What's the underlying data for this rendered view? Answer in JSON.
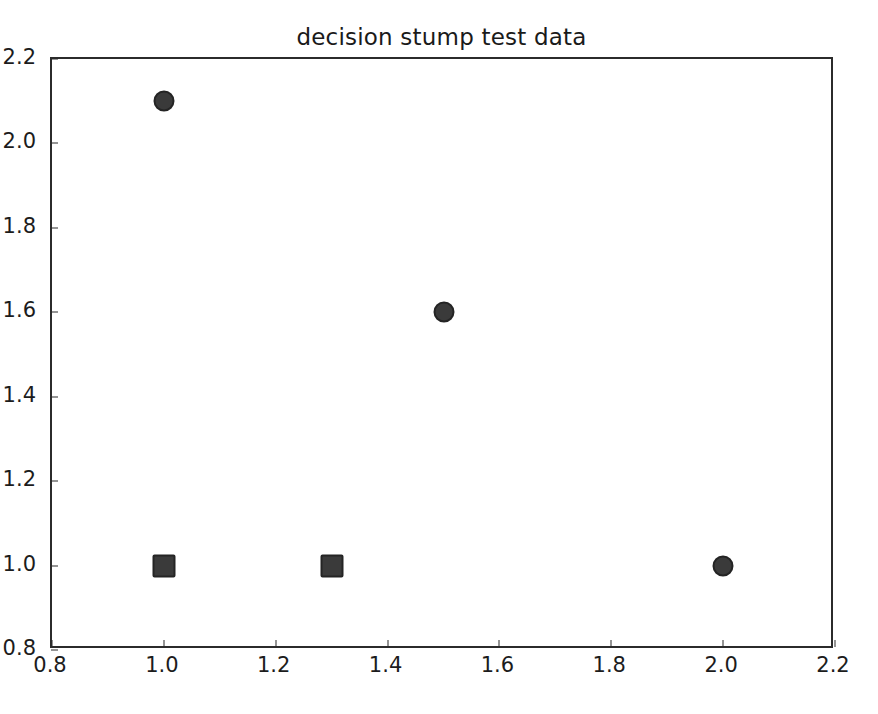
{
  "figure": {
    "background_color": "#ffffff",
    "frame_color": "#2b2b2b",
    "width": 878,
    "height": 714
  },
  "chart_data": {
    "type": "scatter",
    "title": "decision stump test data",
    "xlabel": "",
    "ylabel": "",
    "xlim": [
      0.8,
      2.2
    ],
    "ylim": [
      0.8,
      2.2
    ],
    "grid": false,
    "legend": null,
    "xticks": [
      "0.8",
      "1.0",
      "1.2",
      "1.4",
      "1.6",
      "1.8",
      "2.0",
      "2.2"
    ],
    "xtick_values": [
      0.8,
      1.0,
      1.2,
      1.4,
      1.6,
      1.8,
      2.0,
      2.2
    ],
    "yticks": [
      "0.8",
      "1.0",
      "1.2",
      "1.4",
      "1.6",
      "1.8",
      "2.0",
      "2.2"
    ],
    "ytick_values": [
      0.8,
      1.0,
      1.2,
      1.4,
      1.6,
      1.8,
      2.0,
      2.2
    ],
    "marker_color": "#3a3a3a",
    "marker_edge_color": "#242424",
    "series": [
      {
        "name": "class-positive",
        "marker": "circle",
        "points": [
          {
            "x": 1.0,
            "y": 2.1
          },
          {
            "x": 1.5,
            "y": 1.6
          },
          {
            "x": 2.0,
            "y": 1.0
          }
        ]
      },
      {
        "name": "class-negative",
        "marker": "square",
        "points": [
          {
            "x": 1.0,
            "y": 1.0
          },
          {
            "x": 1.3,
            "y": 1.0
          }
        ]
      }
    ]
  }
}
